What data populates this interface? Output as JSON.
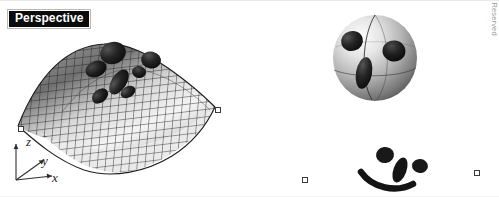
{
  "viewport": {
    "width": 499,
    "height": 197,
    "background_color": "#ffffff",
    "label": "Perspective",
    "label_bg_color": "#0b0b0b",
    "label_text_color": "#ffffff"
  },
  "axis_gizmo": {
    "name": "world-axis-indicator",
    "z_label": "z",
    "y_label": "y",
    "x_label": "x"
  },
  "objects": {
    "surface": {
      "name": "nurbs-saddle-surface",
      "shading": "wireframe-mesh-shaded",
      "mesh_color": "#2c2c2c",
      "fill_light": "#f2f2f2",
      "fill_dark": "#7a7a7a"
    },
    "sphere": {
      "name": "shaded-sphere",
      "fill_light": "#ededed",
      "fill_dark": "#6d6d6d",
      "feature_color": "#161616"
    },
    "face_blobs": {
      "name": "face-feature-blobs",
      "color": "#1a1a1a"
    }
  },
  "control_points": [
    {
      "x": 18,
      "y": 126
    },
    {
      "x": 215,
      "y": 107
    },
    {
      "x": 302,
      "y": 177
    },
    {
      "x": 474,
      "y": 170
    }
  ],
  "copyright": {
    "text": "© 2014 Cengage Learning® All Rights Reserved",
    "color": "#9a9a9a"
  }
}
